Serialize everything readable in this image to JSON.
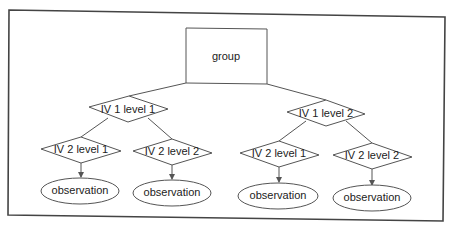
{
  "diagram": {
    "type": "tree",
    "root": {
      "label": "group",
      "shape": "rectangle"
    },
    "level1": [
      {
        "label": "IV 1 level 1",
        "shape": "diamond"
      },
      {
        "label": "IV 1 level 2",
        "shape": "diamond"
      }
    ],
    "level2": [
      {
        "label": "IV 2 level 1",
        "parent": 0,
        "shape": "diamond"
      },
      {
        "label": "IV 2 level 2",
        "parent": 0,
        "shape": "diamond"
      },
      {
        "label": "IV 2 level 1",
        "parent": 1,
        "shape": "diamond"
      },
      {
        "label": "IV 2 level 2",
        "parent": 1,
        "shape": "diamond"
      }
    ],
    "leaves": [
      {
        "label": "observation",
        "shape": "ellipse"
      },
      {
        "label": "observation",
        "shape": "ellipse"
      },
      {
        "label": "observation",
        "shape": "ellipse"
      },
      {
        "label": "observation",
        "shape": "ellipse"
      }
    ],
    "colors": {
      "stroke": "#555555",
      "frame": "#444444",
      "background": "#ffffff"
    }
  }
}
